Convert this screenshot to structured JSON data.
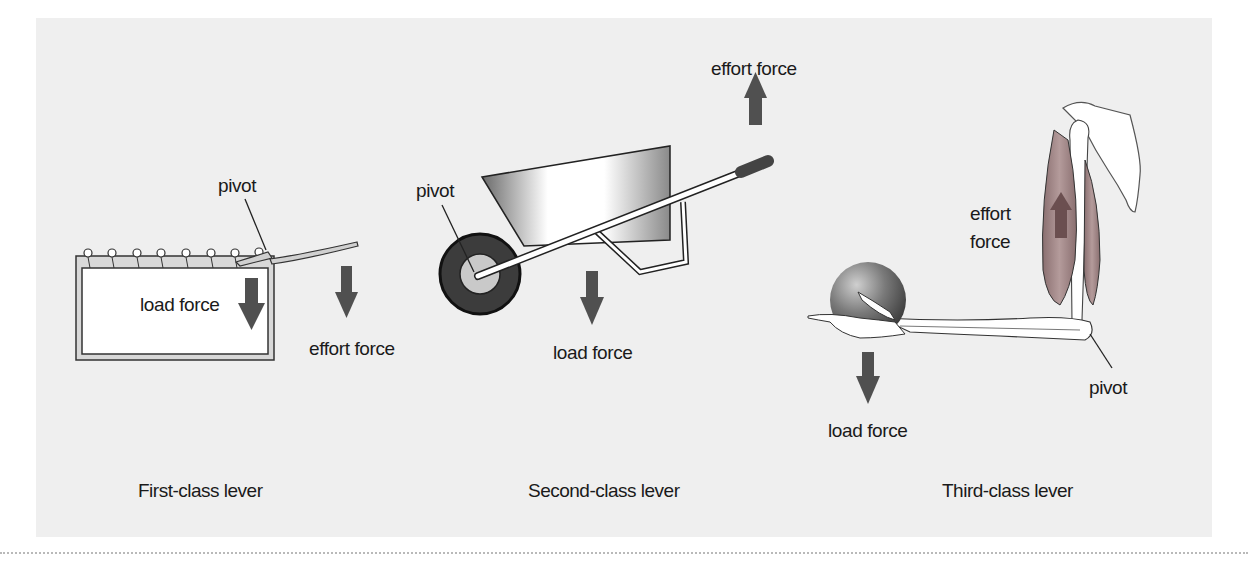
{
  "colors": {
    "panel_bg": "#efefef",
    "arrow": "#505050",
    "wheel_tire": "#3f3f3f",
    "muscle": "#9a7f7f"
  },
  "first_class": {
    "caption": "First-class lever",
    "labels": {
      "pivot": "pivot",
      "load": "load force",
      "effort": "effort force"
    }
  },
  "second_class": {
    "caption": "Second-class lever",
    "labels": {
      "pivot": "pivot",
      "load": "load force",
      "effort": "effort force"
    }
  },
  "third_class": {
    "caption": "Third-class lever",
    "labels": {
      "pivot": "pivot",
      "load": "load force",
      "effort_line1": "effort",
      "effort_line2": "force"
    }
  }
}
